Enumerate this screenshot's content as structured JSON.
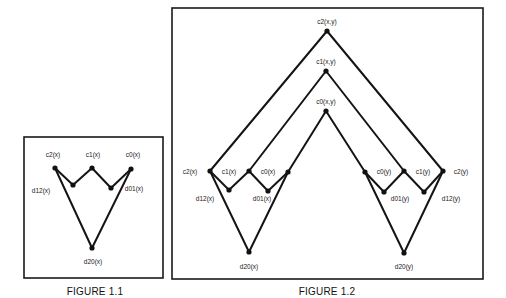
{
  "figures": [
    {
      "id": "fig11",
      "caption": "FIGURE 1.1",
      "nodes": {
        "c2": {
          "label": "c2(x)"
        },
        "c1": {
          "label": "c1(x)"
        },
        "c0": {
          "label": "c0(x)"
        },
        "d12": {
          "label": "d12(x)"
        },
        "d01": {
          "label": "d01(x)"
        },
        "d20": {
          "label": "d20(x)"
        }
      }
    },
    {
      "id": "fig12",
      "caption": "FIGURE 1.2",
      "nodes": {
        "c2xy": {
          "label": "c2(x,y)"
        },
        "c1xy": {
          "label": "c1(x,y)"
        },
        "c0xy": {
          "label": "c0(x,y)"
        },
        "c2x": {
          "label": "c2(x)"
        },
        "c1x": {
          "label": "c1(x)"
        },
        "c0x": {
          "label": "c0(x)"
        },
        "d12x": {
          "label": "d12(x)"
        },
        "d01x": {
          "label": "d01(x)"
        },
        "d20x": {
          "label": "d20(x)"
        },
        "c0y": {
          "label": "c0(y)"
        },
        "c1y": {
          "label": "c1(y)"
        },
        "c2y": {
          "label": "c2(y)"
        },
        "d01y": {
          "label": "d01(y)"
        },
        "d12y": {
          "label": "d12(y)"
        },
        "d20y": {
          "label": "d20(y)"
        }
      }
    }
  ]
}
